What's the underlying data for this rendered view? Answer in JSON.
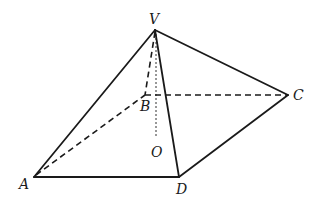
{
  "diagram": {
    "type": "square-pyramid",
    "colors": {
      "stroke": "#1a1a1a",
      "background": "#ffffff"
    },
    "points": {
      "V": {
        "label": "V",
        "x": 155,
        "y": 30
      },
      "A": {
        "label": "A",
        "x": 34,
        "y": 177
      },
      "B": {
        "label": "B",
        "x": 145,
        "y": 95
      },
      "C": {
        "label": "C",
        "x": 288,
        "y": 95
      },
      "D": {
        "label": "D",
        "x": 179,
        "y": 177
      },
      "O": {
        "label": "O",
        "x": 156,
        "y": 137
      }
    },
    "labels": {
      "V": "V",
      "A": "A",
      "B": "B",
      "C": "C",
      "D": "D",
      "O": "O"
    },
    "solid_edges": [
      "VA",
      "VD",
      "VC",
      "AD",
      "DC"
    ],
    "dashed_edges": [
      "VB",
      "AB",
      "BC"
    ],
    "dotted_edges": [
      "VO"
    ]
  }
}
